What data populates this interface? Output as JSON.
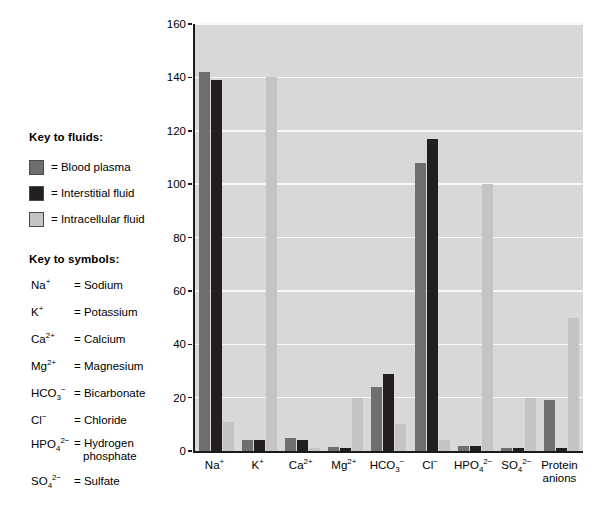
{
  "key_to_fluids": {
    "heading": "Key to fluids:",
    "items": [
      {
        "label": "= Blood plasma",
        "color": "#6e6e6e",
        "name": "blood-plasma"
      },
      {
        "label": "= Interstitial fluid",
        "color": "#231f20",
        "name": "interstitial-fluid"
      },
      {
        "label": "= Intracellular fluid",
        "color": "#c4c4c4",
        "name": "intracellular-fluid"
      }
    ]
  },
  "key_to_symbols": {
    "heading": "Key to symbols:",
    "items": [
      {
        "formula_html": "Na<sup>+</sup>",
        "definition": "= Sodium"
      },
      {
        "formula_html": "K<sup>+</sup>",
        "definition": "= Potassium"
      },
      {
        "formula_html": "Ca<sup>2+</sup>",
        "definition": "= Calcium"
      },
      {
        "formula_html": "Mg<sup>2+</sup>",
        "definition": "= Magnesium"
      },
      {
        "formula_html": "HCO<sub>3</sub><sup>&#8722;</sup>",
        "definition": "= Bicarbonate"
      },
      {
        "formula_html": "Cl<sup>&#8722;</sup>",
        "definition": "= Chloride"
      },
      {
        "formula_html": "HPO<sub>4</sub><sup>2&#8722;</sup>",
        "definition": "= Hydrogen\nphosphate"
      },
      {
        "formula_html": "SO<sub>4</sub><sup>2&#8722;</sup>",
        "definition": "= Sulfate"
      }
    ]
  },
  "chart_data": {
    "type": "bar",
    "title": "",
    "xlabel": "",
    "ylabel": "Total solute concentration (mEq/L)",
    "ylim": [
      0,
      160
    ],
    "yticks": [
      0,
      20,
      40,
      60,
      80,
      100,
      120,
      140,
      160
    ],
    "grid": true,
    "legend_position": "left-external",
    "categories": [
      "Na⁺",
      "K⁺",
      "Ca²⁺",
      "Mg²⁺",
      "HCO₃⁻",
      "Cl⁻",
      "HPO₄²⁻",
      "SO₄²⁻",
      "Protein anions"
    ],
    "categories_html": [
      "Na<sup>+</sup>",
      "K<sup>+</sup>",
      "Ca<sup>2+</sup>",
      "Mg<sup>2+</sup>",
      "HCO<sub>3</sub><sup>&#8722;</sup>",
      "Cl<sup>&#8722;</sup>",
      "HPO<sub>4</sub><sup>2&#8722;</sup>",
      "SO<sub>4</sub><sup>2&#8722;</sup>",
      "Protein<br>anions"
    ],
    "series": [
      {
        "name": "Blood plasma",
        "color": "#6e6e6e",
        "values": [
          142,
          4,
          5,
          1.5,
          24,
          108,
          2,
          1,
          19
        ]
      },
      {
        "name": "Interstitial fluid",
        "color": "#231f20",
        "values": [
          139,
          4,
          4,
          1,
          29,
          117,
          2,
          1,
          1
        ]
      },
      {
        "name": "Intracellular fluid",
        "color": "#c4c4c4",
        "values": [
          11,
          140,
          1,
          20,
          10,
          4,
          100,
          20,
          50
        ]
      }
    ]
  }
}
